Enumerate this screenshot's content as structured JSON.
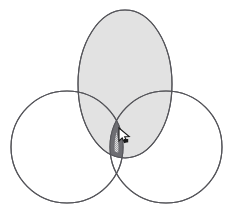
{
  "figure": {
    "title": "",
    "caption": "",
    "type": "venn-diagram",
    "canvas": {
      "width": 231,
      "height": 217,
      "background": "#ffffff"
    },
    "colors": {
      "outline": "#55555a",
      "ellipse_fill": "#e2e2e2",
      "circle_fill": "#ffffff",
      "intersection_border": "#6e6e73",
      "intersection_fill": "#d4d4d4",
      "intersection_stipple": "#a8a8ac",
      "cursor_fill": "#ffffff",
      "cursor_stroke": "#1a1a1a"
    },
    "shapes": [
      {
        "name": "top-ellipse",
        "label": "",
        "kind": "ellipse",
        "cx": 125,
        "cy": 84,
        "rx": 47,
        "ry": 74,
        "fill": "#e2e2e2",
        "stroke": "#55555a",
        "stroke_width": 1.1,
        "shaded": true
      },
      {
        "name": "left-circle",
        "label": "",
        "kind": "circle",
        "cx": 67,
        "cy": 147,
        "r": 56,
        "fill": "none",
        "stroke": "#55555a",
        "stroke_width": 1.1,
        "shaded": false
      },
      {
        "name": "right-circle",
        "label": "",
        "kind": "circle",
        "cx": 166,
        "cy": 147,
        "r": 56,
        "fill": "none",
        "stroke": "#55555a",
        "stroke_width": 1.1,
        "shaded": false
      }
    ],
    "intersection": {
      "name": "triple-intersection",
      "label": "",
      "highlighted": true,
      "fill": "#d4d4d4",
      "border": "#6e6e73",
      "border_width": 5,
      "pattern": "stipple-dots",
      "bounds": {
        "x": 88,
        "y": 109,
        "width": 58,
        "height": 50
      }
    },
    "cursor": {
      "name": "mouse-cursor",
      "kind": "arrow-pointer",
      "x": 119,
      "y": 128
    }
  }
}
